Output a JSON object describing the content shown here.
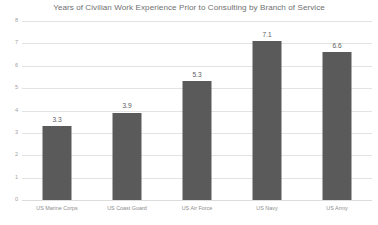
{
  "chart_data": {
    "type": "bar",
    "title": "Years of Civilian Work Experience Prior to Consulting by Branch of Service",
    "xlabel": "",
    "ylabel": "",
    "categories": [
      "US Marine Corps",
      "US Coast Guard",
      "US Air Force",
      "US Navy",
      "US Army"
    ],
    "values": [
      3.3,
      3.9,
      5.3,
      7.1,
      6.6
    ],
    "value_labels": [
      "3.3",
      "3.9",
      "5.3",
      "7.1",
      "6.6"
    ],
    "ylim": [
      0,
      8
    ],
    "ytick_values": [
      0,
      1,
      2,
      3,
      4,
      5,
      6,
      7,
      8
    ],
    "ytick_labels": [
      "0",
      "1",
      "2",
      "3",
      "4",
      "5",
      "6",
      "7",
      "8"
    ],
    "grid": true,
    "legend": false,
    "legend_position": "none",
    "colors": {
      "bar": "#5a5a5a",
      "gridline": "#e3e3e3",
      "title_text": "#6f6f6f",
      "tick_text": "#a2a2a2",
      "category_text": "#8c8c8c",
      "value_text": "#5e5e5e",
      "background": "#ffffff"
    }
  }
}
